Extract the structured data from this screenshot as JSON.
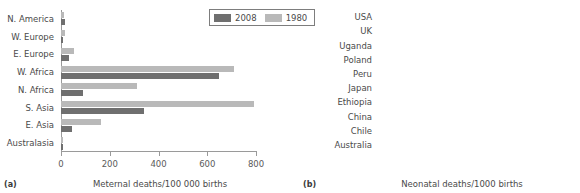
{
  "figure": {
    "legend": {
      "items": [
        {
          "label": "2008",
          "color": "#6f6f6f",
          "key": "s2008"
        },
        {
          "label": "1980",
          "color": "#b9b9b9",
          "key": "s1980"
        }
      ]
    }
  },
  "panel_a": {
    "tag": "(a)",
    "axis_title": "Meternal deaths/100 000 births"
  },
  "panel_b": {
    "tag": "(b)",
    "axis_title": "Neonatal deaths/1000 births"
  },
  "chart_data": [
    {
      "id": "panel-a",
      "type": "bar",
      "orientation": "horizontal",
      "title": "",
      "xlabel": "Meternal deaths/100 000 births",
      "ylabel": "",
      "xlim": [
        0,
        800
      ],
      "xticks": [
        0,
        200,
        400,
        600,
        800
      ],
      "xticklabels": [
        "0",
        "200",
        "400",
        "600",
        "800"
      ],
      "grid": false,
      "legend_position": "top-right",
      "categories": [
        "N. America",
        "W. Europe",
        "E. Europe",
        "W. Africa",
        "N. Africa",
        "S. Asia",
        "E. Asia",
        "Australasia"
      ],
      "series": [
        {
          "name": "2008",
          "color": "#6f6f6f",
          "values": [
            15,
            10,
            32,
            650,
            90,
            340,
            45,
            8
          ]
        },
        {
          "name": "1980",
          "color": "#b9b9b9",
          "values": [
            12,
            15,
            55,
            710,
            310,
            790,
            165,
            9
          ]
        }
      ]
    },
    {
      "id": "panel-b",
      "type": "bar",
      "orientation": "horizontal",
      "title": "",
      "xlabel": "Neonatal deaths/1000 births",
      "ylabel": "",
      "xlim": [
        0,
        40
      ],
      "xticks": [
        0,
        10,
        20,
        30,
        40
      ],
      "xticklabels": [
        "0",
        "10",
        "20",
        "30",
        "40"
      ],
      "grid": false,
      "legend_position": "none",
      "categories": [
        "USA",
        "UK",
        "Uganda",
        "Poland",
        "Peru",
        "Japan",
        "Ethiopia",
        "China",
        "Chile",
        "Australia"
      ],
      "series": [
        {
          "name": "Neonatal deaths",
          "color": "#6f6f6f",
          "values": [
            4.4,
            3.3,
            23.4,
            3.3,
            9.3,
            1.2,
            29.2,
            9.3,
            5.3,
            3.3
          ]
        }
      ]
    }
  ]
}
